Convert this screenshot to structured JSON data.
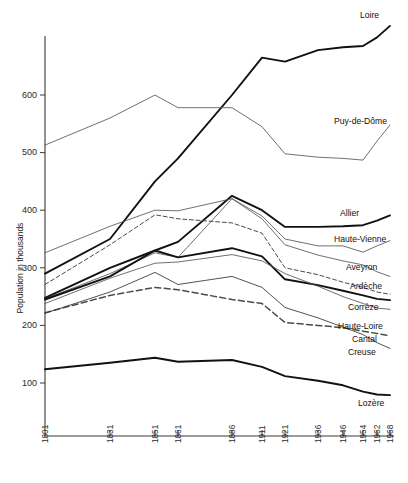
{
  "chart_data": {
    "type": "line",
    "title": "",
    "xlabel": "",
    "ylabel": "Population in thousands",
    "x": [
      1801,
      1831,
      1851,
      1861,
      1886,
      1911,
      1921,
      1936,
      1946,
      1954,
      1962,
      1968
    ],
    "xtick_labels": [
      "1801",
      "1831",
      "1851",
      "1861",
      "1886",
      "1911",
      "1921",
      "1936",
      "1946",
      "1954",
      "1962",
      "1968"
    ],
    "ytick_labels": [
      "100",
      "200",
      "300",
      "400",
      "500",
      "600"
    ],
    "yticks": [
      100,
      200,
      300,
      400,
      500,
      600
    ],
    "ylim": [
      30,
      720
    ],
    "xlim": [
      1801,
      1968
    ],
    "grid": false,
    "legend_position": "right-inline-labels",
    "series": [
      {
        "name": "Loire",
        "style": "solid-thick",
        "color": "#111111",
        "values": [
          290,
          350,
          450,
          490,
          600,
          665,
          658,
          678,
          683,
          685,
          700,
          720
        ]
      },
      {
        "name": "Puy-de-Dôme",
        "style": "solid-thin",
        "color": "#555555",
        "values": [
          513,
          560,
          600,
          578,
          578,
          545,
          498,
          492,
          490,
          487,
          520,
          548
        ]
      },
      {
        "name": "Allier",
        "style": "solid-thick",
        "color": "#111111",
        "values": [
          248,
          300,
          330,
          345,
          425,
          400,
          371,
          371,
          372,
          374,
          382,
          391
        ]
      },
      {
        "name": "Haute-Vienne",
        "style": "solid-thin",
        "color": "#555555",
        "values": [
          326,
          372,
          400,
          399,
          420,
          390,
          350,
          338,
          338,
          327,
          338,
          347
        ]
      },
      {
        "name": "Aveyron",
        "style": "solid-thin",
        "color": "#555555",
        "values": [
          246,
          290,
          326,
          318,
          420,
          385,
          340,
          322,
          312,
          305,
          293,
          285
        ]
      },
      {
        "name": "Ardèche",
        "style": "dashed-fine",
        "color": "#4a4a4a",
        "values": [
          271,
          340,
          392,
          385,
          378,
          360,
          300,
          288,
          275,
          266,
          258,
          254
        ]
      },
      {
        "name": "Corrèze",
        "style": "solid-thick",
        "color": "#111111",
        "values": [
          245,
          285,
          330,
          318,
          334,
          320,
          280,
          270,
          260,
          252,
          246,
          244
        ]
      },
      {
        "name": "Haute-Loire",
        "style": "solid-thin",
        "color": "#555555",
        "values": [
          238,
          282,
          308,
          310,
          323,
          312,
          290,
          268,
          250,
          238,
          230,
          228
        ]
      },
      {
        "name": "Cantal",
        "style": "dashed-coarse",
        "color": "#4a4a4a",
        "values": [
          222,
          252,
          266,
          262,
          245,
          238,
          205,
          200,
          196,
          190,
          186,
          182
        ]
      },
      {
        "name": "Creuse",
        "style": "solid-thin",
        "color": "#333333",
        "values": [
          221,
          258,
          292,
          271,
          285,
          266,
          231,
          213,
          197,
          184,
          170,
          160
        ]
      },
      {
        "name": "Lozère",
        "style": "solid-thick",
        "color": "#111111",
        "values": [
          124,
          135,
          144,
          137,
          140,
          128,
          112,
          104,
          96,
          85,
          80,
          79
        ]
      }
    ],
    "series_labels": [
      {
        "name": "Loire",
        "x": 360,
        "y": 18
      },
      {
        "name": "Puy-de-Dôme",
        "x": 334,
        "y": 124
      },
      {
        "name": "Allier",
        "x": 340,
        "y": 216
      },
      {
        "name": "Haute-Vienne",
        "x": 334,
        "y": 242
      },
      {
        "name": "Aveyron",
        "x": 346,
        "y": 270
      },
      {
        "name": "Ardèche",
        "x": 350,
        "y": 289
      },
      {
        "name": "Corrèze",
        "x": 348,
        "y": 310
      },
      {
        "name": "Haute-Loire",
        "x": 338,
        "y": 329
      },
      {
        "name": "Cantal",
        "x": 352,
        "y": 342
      },
      {
        "name": "Creuse",
        "x": 348,
        "y": 355
      },
      {
        "name": "Lozère",
        "x": 358,
        "y": 406
      }
    ]
  },
  "axes": {
    "y_title": "Population in thousands"
  }
}
